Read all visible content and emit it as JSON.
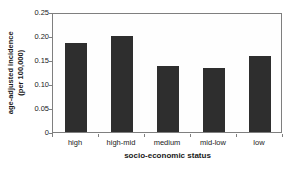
{
  "figure": {
    "y_axis_title_line1": "age-adjusted incidence",
    "y_axis_title_line2": "(per 100,000)",
    "x_axis_title": "socio-economic status"
  },
  "chart_data": {
    "type": "bar",
    "title": "",
    "categories": [
      "high",
      "high-mid",
      "medium",
      "mid-low",
      "low"
    ],
    "values": [
      0.185,
      0.2,
      0.138,
      0.134,
      0.158
    ],
    "xlabel": "socio-economic status",
    "ylabel": "age-adjusted incidence (per 100,000)",
    "ylim": [
      0,
      0.25
    ],
    "yticks": [
      {
        "value": 0,
        "label": "0"
      },
      {
        "value": 0.05,
        "label": "0.05"
      },
      {
        "value": 0.1,
        "label": "0.10"
      },
      {
        "value": 0.15,
        "label": "0.15"
      },
      {
        "value": 0.2,
        "label": "0.20"
      },
      {
        "value": 0.25,
        "label": "0.25"
      }
    ],
    "grid": false,
    "legend_position": "none",
    "colors": {
      "bar": "#2e2e2e",
      "frame": "#7f7f7f",
      "text": "#1a1a1a",
      "background": "#ffffff"
    }
  }
}
